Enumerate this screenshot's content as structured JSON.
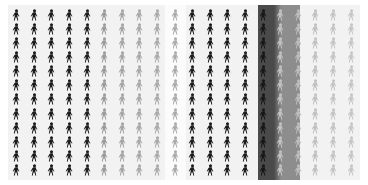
{
  "chart_data": {
    "type": "pictogram",
    "title": "",
    "subtitle": "",
    "xlabel": "",
    "ylabel": "",
    "legend": [],
    "annotations": [],
    "grid": false,
    "icon_glyph": "person-icon",
    "rows": 12,
    "columns": 20,
    "icons_per_column": 12,
    "total_icons": 240,
    "background_color": "#f2f2f2",
    "page_background": "#ffffff",
    "highlight": {
      "label": "",
      "column_index": 14,
      "left_pct": 71.0,
      "width_pct": 12.0,
      "color_dark": "#4a4a4a",
      "color_light": "#8d8d8d"
    },
    "gap": {
      "left_pct": 44.5,
      "width_pct": 6.0,
      "color": "#fbfbfb"
    },
    "categories": [
      "c1",
      "c2",
      "c3",
      "c4",
      "c5",
      "c6",
      "c7",
      "c8",
      "c9",
      "c10",
      "c11",
      "c12",
      "c13",
      "c14",
      "c15",
      "c16",
      "c17",
      "c18",
      "c19",
      "c20"
    ],
    "values": [
      12,
      12,
      12,
      12,
      12,
      12,
      12,
      12,
      12,
      12,
      12,
      12,
      12,
      12,
      12,
      12,
      12,
      12,
      12,
      12
    ],
    "series": [
      {
        "name": "intensity",
        "values": [
          0.95,
          0.95,
          0.95,
          0.95,
          0.93,
          0.42,
          0.38,
          0.36,
          0.34,
          0.32,
          0.92,
          0.94,
          0.94,
          0.93,
          0.95,
          0.24,
          0.26,
          0.25,
          0.23,
          0.22
        ]
      }
    ],
    "column_colors": [
      "#1a1a1a",
      "#1a1a1a",
      "#1c1c1c",
      "#1c1c1c",
      "#202020",
      "#9a9a9a",
      "#a4a4a4",
      "#a8a8a8",
      "#aaaaaa",
      "#ababab",
      "#1d1d1d",
      "#191919",
      "#1b1b1b",
      "#1d1d1d",
      "#171717",
      "#c2c2c2",
      "#bdbdbd",
      "#c0c0c0",
      "#c4c4c4",
      "#c6c6c6"
    ]
  }
}
